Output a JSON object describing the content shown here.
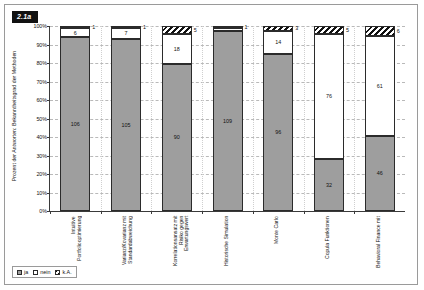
{
  "figure": {
    "caption_tag": "2.1a",
    "ylabel": "Prozent der Antworten: Bekanntheitsgrad der Methoden"
  },
  "legend": {
    "items": [
      {
        "key": "ja",
        "label": "ja",
        "swatch": "solid-gray-swatch",
        "color": "#9e9e9e"
      },
      {
        "key": "nein",
        "label": "nein",
        "swatch": "white-swatch",
        "color": "#ffffff"
      },
      {
        "key": "ka",
        "label": "k.A.",
        "swatch": "hatched-swatch",
        "color": "#111111"
      }
    ]
  },
  "chart_data": {
    "type": "bar",
    "subtype": "stacked-100-percent",
    "title": "",
    "xlabel": "",
    "ylabel": "Prozent der Antworten: Bekanntheitsgrad der Methoden",
    "ylim": [
      0,
      100
    ],
    "yticks": [
      "0%",
      "10%",
      "20%",
      "30%",
      "40%",
      "50%",
      "60%",
      "70%",
      "80%",
      "90%",
      "100%"
    ],
    "ytick_values": [
      0,
      10,
      20,
      30,
      40,
      50,
      60,
      70,
      80,
      90,
      100
    ],
    "grid": "horizontal-dashed",
    "legend_position": "bottom-left",
    "categories": [
      "Intuitive Portfoliooptimierung",
      "Varianz/Kovarianz mit Standardabweichung",
      "Korrelationsansatz mit Risiko gegen Erwartungswert",
      "Historische Simulation",
      "Monte Carlo",
      "Copula Funktionen",
      "Behavioral Finance mit"
    ],
    "series": [
      {
        "name": "ja",
        "color": "#9e9e9e",
        "values": [
          106,
          105,
          90,
          109,
          96,
          32,
          46
        ]
      },
      {
        "name": "nein",
        "color": "#ffffff",
        "values": [
          6,
          7,
          18,
          2,
          14,
          76,
          61
        ]
      },
      {
        "name": "k.A.",
        "color": "#111111",
        "values": [
          1,
          1,
          5,
          1,
          3,
          5,
          6
        ]
      }
    ],
    "bars": [
      {
        "category": "Intuitive Portfoliooptimierung",
        "ja": 106,
        "nein": 6,
        "ka": 1,
        "total": 113,
        "ja_label": "106",
        "nein_label": "6",
        "ka_label": "1",
        "ka_label_outside": true
      },
      {
        "category": "Varianz/Kovarianz mit Standardabweichung",
        "ja": 105,
        "nein": 7,
        "ka": 1,
        "total": 113,
        "ja_label": "105",
        "nein_label": "7",
        "ka_label": "1",
        "ka_label_outside": true
      },
      {
        "category": "Korrelationsansatz mit Risiko gegen Erwartungswert",
        "ja": 90,
        "nein": 18,
        "ka": 5,
        "total": 113,
        "ja_label": "90",
        "nein_label": "18",
        "ka_label": "5",
        "ka_label_outside": true
      },
      {
        "category": "Historische Simulation",
        "ja": 109,
        "nein": 2,
        "ka": 1,
        "total": 112,
        "ja_label": "109",
        "nein_label": "",
        "ka_label": "1",
        "ka_label_outside": true
      },
      {
        "category": "Monte Carlo",
        "ja": 96,
        "nein": 14,
        "ka": 3,
        "total": 113,
        "ja_label": "96",
        "nein_label": "14",
        "ka_label": "3",
        "ka_label_outside": true
      },
      {
        "category": "Copula Funktionen",
        "ja": 32,
        "nein": 76,
        "ka": 5,
        "total": 113,
        "ja_label": "32",
        "nein_label": "76",
        "ka_label": "5",
        "ka_label_outside": true
      },
      {
        "category": "Behavioral Finance mit",
        "ja": 46,
        "nein": 61,
        "ka": 6,
        "total": 113,
        "ja_label": "46",
        "nein_label": "61",
        "ka_label": "6",
        "ka_label_outside": true
      }
    ]
  }
}
